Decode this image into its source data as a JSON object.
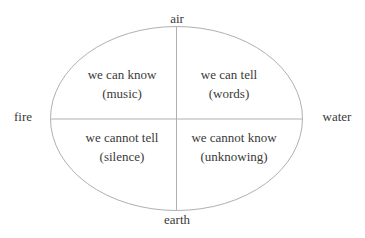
{
  "diagram": {
    "labels": {
      "top": "air",
      "bottom": "earth",
      "left": "fire",
      "right": "water"
    },
    "quadrants": {
      "top_left": {
        "line1": "we can know",
        "line2": "(music)"
      },
      "top_right": {
        "line1": "we can tell",
        "line2": "(words)"
      },
      "bottom_left": {
        "line1": "we cannot tell",
        "line2": "(silence)"
      },
      "bottom_right": {
        "line1": "we cannot know",
        "line2": "(unknowing)"
      }
    },
    "colors": {
      "line": "#b0b0b0",
      "text": "#3a3a3a"
    }
  }
}
